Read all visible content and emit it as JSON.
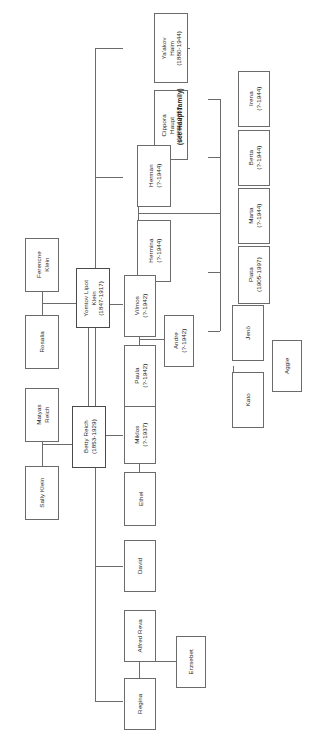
{
  "diagram": {
    "type": "family-tree",
    "orientation": "rotated-90-counterclockwise",
    "annotations": [
      {
        "id": "haupt-note",
        "text": "(see Haupt family)"
      }
    ],
    "people": [
      {
        "id": "yaakov-haim",
        "name": "Ya'akov\nHaim",
        "name_line1": "Ya'akov",
        "name_line2": "Haim",
        "dates": "(1880-1944)"
      },
      {
        "id": "cippora-haupt",
        "name": "Cippora\nHaupt",
        "name_line1": "Cippora",
        "name_line2": "Haupt",
        "dates": "(1886-1935)"
      },
      {
        "id": "herman",
        "name": "Herman",
        "name_line1": "Herman",
        "name_line2": "",
        "dates": "(?-1944)"
      },
      {
        "id": "hermina",
        "name": "Hermina",
        "name_line1": "Hermina",
        "name_line2": "",
        "dates": "(?-1944)"
      },
      {
        "id": "irena",
        "name": "Irena",
        "name_line1": "Irena",
        "name_line2": "",
        "dates": "(?-1944)"
      },
      {
        "id": "berta",
        "name": "Berta",
        "name_line1": "Berta",
        "name_line2": "",
        "dates": "(?-1944)"
      },
      {
        "id": "marta",
        "name": "Marta",
        "name_line1": "Marta",
        "name_line2": "",
        "dates": "(?-1944)"
      },
      {
        "id": "piata",
        "name": "Piata",
        "name_line1": "Piata",
        "name_line2": "",
        "dates": "(1905-1997)"
      },
      {
        "id": "jeno",
        "name": "Jenö",
        "name_line1": "Jenö",
        "name_line2": "",
        "dates": ""
      },
      {
        "id": "kato",
        "name": "Kato",
        "name_line1": "Kato",
        "name_line2": "",
        "dates": ""
      },
      {
        "id": "aggie",
        "name": "Aggie",
        "name_line1": "Aggie",
        "name_line2": "",
        "dates": ""
      },
      {
        "id": "ferencne-klein",
        "name": "Ferencne\nKlein",
        "name_line1": "Ferencne",
        "name_line2": "Klein",
        "dates": ""
      },
      {
        "id": "rosalia",
        "name": "Rosalia",
        "name_line1": "Rosalia",
        "name_line2": "",
        "dates": ""
      },
      {
        "id": "yomtov-lipot-klein",
        "name": "Yomtov Lipot\nKlein",
        "name_line1": "Yomtov Lipot",
        "name_line2": "Klein",
        "dates": "(1847-1917)"
      },
      {
        "id": "matyas-reich",
        "name": "Matyas\nReich",
        "name_line1": "Matyas",
        "name_line2": "Reich",
        "dates": ""
      },
      {
        "id": "sally-klein",
        "name": "Sally Klein",
        "name_line1": "Sally Klein",
        "name_line2": "",
        "dates": ""
      },
      {
        "id": "betty-reich",
        "name": "Betty Reich",
        "name_line1": "Betty Reich",
        "name_line2": "",
        "dates": "(1853-1929)"
      },
      {
        "id": "vilmos",
        "name": "Vilmos",
        "name_line1": "Vilmos",
        "name_line2": "",
        "dates": "(?-1942)"
      },
      {
        "id": "paula",
        "name": "Paula",
        "name_line1": "Paula",
        "name_line2": "",
        "dates": "(?-1942)"
      },
      {
        "id": "andre",
        "name": "Andre",
        "name_line1": "Andre",
        "name_line2": "",
        "dates": "(?-1942)"
      },
      {
        "id": "miklos",
        "name": "Miklos",
        "name_line1": "Miklos",
        "name_line2": "",
        "dates": "(?-1937)"
      },
      {
        "id": "ethel",
        "name": "Ethel",
        "name_line1": "Ethel",
        "name_line2": "",
        "dates": ""
      },
      {
        "id": "david",
        "name": "David",
        "name_line1": "David",
        "name_line2": "",
        "dates": ""
      },
      {
        "id": "alfred-reva",
        "name": "Alfred Reva",
        "name_line1": "Alfred Reva",
        "name_line2": "",
        "dates": ""
      },
      {
        "id": "regina",
        "name": "Regina",
        "name_line1": "Regina",
        "name_line2": "",
        "dates": ""
      },
      {
        "id": "erzsebet",
        "name": "Erzsebet",
        "name_line1": "Erzsebet",
        "name_line2": "",
        "dates": ""
      }
    ]
  }
}
